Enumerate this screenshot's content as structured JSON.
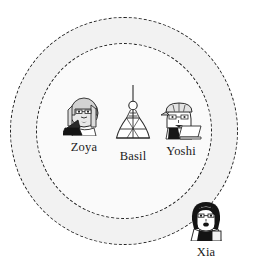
{
  "scene": {
    "width": 265,
    "height": 267,
    "background": "#ffffff",
    "stroke_color": "#1d1d1d"
  },
  "rings": [
    {
      "id": "outer-ring",
      "name": "outer-boundary-circle",
      "style": "dashed",
      "fill": "#f2f2f2",
      "label": ""
    },
    {
      "id": "inner-ring",
      "name": "inner-boundary-circle",
      "style": "dashed",
      "fill": "#fafafa",
      "label": ""
    }
  ],
  "nodes": [
    {
      "id": "zoya",
      "label": "Zoya",
      "icon": "person-with-laptop-icon",
      "position": "inside-inner-circle-left"
    },
    {
      "id": "basil",
      "label": "Basil",
      "icon": "broadcast-tower-icon",
      "position": "inside-inner-circle-center"
    },
    {
      "id": "yoshi",
      "label": "Yoshi",
      "icon": "person-with-cap-and-laptop-icon",
      "position": "inside-inner-circle-right"
    },
    {
      "id": "xia",
      "label": "Xia",
      "icon": "person-dark-bob-hair-icon",
      "position": "on-inner-circle-edge-bottom-right"
    }
  ]
}
